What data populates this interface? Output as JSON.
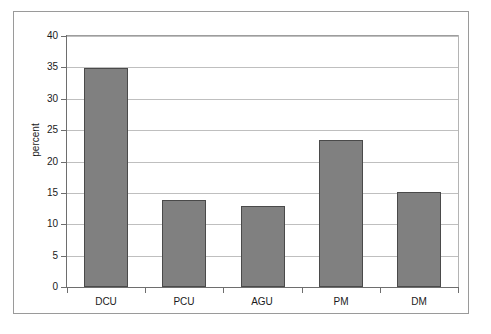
{
  "chart_data": {
    "type": "bar",
    "title": "",
    "subtitle": "",
    "xlabel": "",
    "ylabel": "percent",
    "categories": [
      "DCU",
      "PCU",
      "AGU",
      "PM",
      "DM"
    ],
    "values": [
      34.9,
      13.8,
      12.9,
      23.4,
      15.2
    ],
    "series": [
      {
        "name": "percent",
        "values": [
          34.9,
          13.8,
          12.9,
          23.4,
          15.2
        ]
      }
    ],
    "ylim": [
      0,
      40
    ],
    "ytick_step": 5,
    "yticks": [
      "40",
      "35",
      "30",
      "25",
      "20",
      "15",
      "10",
      "5",
      "0"
    ],
    "ytick_values": [
      40,
      35,
      30,
      25,
      20,
      15,
      10,
      5,
      0
    ],
    "grid": "horizontal",
    "legend": "none",
    "legend_position": "none",
    "annotations": [],
    "colors": {
      "bar_fill": "#808080",
      "bar_border": "#4a4a4a",
      "gridline": "#bfbfbf",
      "axis": "#6e6e6e",
      "frame": "#9a9a9a",
      "background": "#ffffff",
      "text": "#1a1a1a"
    }
  }
}
